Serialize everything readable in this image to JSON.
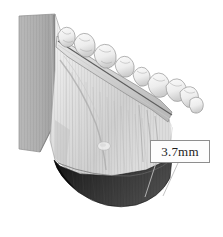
{
  "figure": {
    "background_color": "#ffffff",
    "width": 223,
    "height": 237
  },
  "annotations": {
    "measurement": {
      "label": "3.7mm",
      "value": 3.7,
      "unit": "mm",
      "box_border_color": "#8e8e8e",
      "box_fill_color": "#fdfdfd",
      "text_color": "#1b1b1b",
      "leader_line_color": "#bcbcbc"
    }
  },
  "regions": {
    "ramus_cut_plane": {
      "name": "ramus-cut-plane",
      "fill_color": "#aeaeae"
    },
    "mandible_body": {
      "name": "mandible-body",
      "fill_color": "#e3e3e3"
    },
    "dentition": {
      "name": "tooth-row",
      "fill_color": "#f2f2f2",
      "tooth_count": 9
    },
    "inferior_border_shadow": {
      "name": "inferior-border-shadow",
      "fill_color": "#262626"
    }
  }
}
